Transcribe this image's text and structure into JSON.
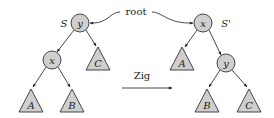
{
  "diagram": {
    "root_label": "root",
    "operation_label": "Zig",
    "colors": {
      "node_fill": "#cfcfcf",
      "stroke": "#333333",
      "text": "#222222"
    },
    "before": {
      "tree_label": "S",
      "nodes": [
        {
          "id": "y",
          "label": "y",
          "role": "root"
        },
        {
          "id": "x",
          "label": "x",
          "role": "left child of y"
        }
      ],
      "subtrees": [
        {
          "label": "A",
          "parent": "x",
          "side": "left"
        },
        {
          "label": "B",
          "parent": "x",
          "side": "right"
        },
        {
          "label": "C",
          "parent": "y",
          "side": "right"
        }
      ]
    },
    "after": {
      "tree_label": "S'",
      "nodes": [
        {
          "id": "x",
          "label": "x",
          "role": "root"
        },
        {
          "id": "y",
          "label": "y",
          "role": "right child of x"
        }
      ],
      "subtrees": [
        {
          "label": "A",
          "parent": "x",
          "side": "left"
        },
        {
          "label": "B",
          "parent": "y",
          "side": "left"
        },
        {
          "label": "C",
          "parent": "y",
          "side": "right"
        }
      ]
    }
  }
}
